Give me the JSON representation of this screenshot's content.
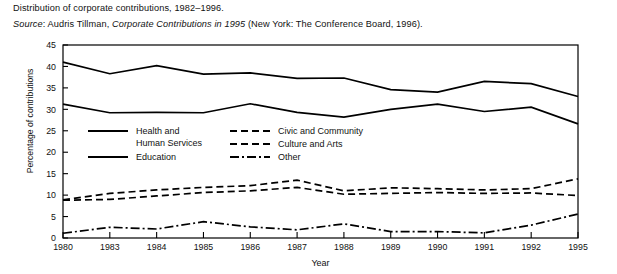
{
  "caption": {
    "line1": "Distribution of corporate contributions, 1982–1996.",
    "source_label": "Source",
    "source_sep": ": ",
    "source_author": "Audris Tillman, ",
    "source_title": "Corporate Contributions in 1995",
    "source_rest": " (New York: The Conference Board, 1996)."
  },
  "chart_data": {
    "type": "line",
    "title": "",
    "xlabel": "Year",
    "ylabel": "Percentage of contributions",
    "categories": [
      "1980",
      "1983",
      "1984",
      "1985",
      "1986",
      "1987",
      "1988",
      "1989",
      "1990",
      "1991",
      "1992",
      "1995"
    ],
    "x": [
      1980,
      1983,
      1984,
      1985,
      1986,
      1987,
      1988,
      1989,
      1990,
      1991,
      1992,
      1995
    ],
    "ylim": [
      0,
      45
    ],
    "xlim": [
      0,
      11
    ],
    "yticks": [
      0,
      5,
      10,
      15,
      20,
      25,
      30,
      35,
      40,
      45
    ],
    "ytick_labels": [
      "0",
      "5",
      "10",
      "15",
      "20",
      "25",
      "30",
      "35",
      "40",
      "45"
    ],
    "grid": false,
    "legend_position": "inside-upper-left",
    "series": [
      {
        "name": "Health and Human Services",
        "legend_label_line1": "Health and",
        "legend_label_line2": "Human Services",
        "style": "solid",
        "values": [
          41.0,
          38.3,
          40.2,
          38.2,
          38.5,
          37.2,
          37.3,
          34.6,
          34.0,
          36.5,
          36.0,
          33.0
        ]
      },
      {
        "name": "Education",
        "legend_label_line1": "Education",
        "legend_label_line2": "",
        "style": "solid",
        "values": [
          31.2,
          29.2,
          29.3,
          29.2,
          31.3,
          29.3,
          28.2,
          30.0,
          31.2,
          29.5,
          30.5,
          26.6
        ]
      },
      {
        "name": "Civic and Community",
        "legend_label_line1": "Civic and Community",
        "legend_label_line2": "",
        "style": "dashed",
        "values": [
          8.9,
          10.4,
          11.2,
          11.8,
          12.2,
          13.5,
          11.0,
          11.7,
          11.5,
          11.2,
          11.5,
          13.8
        ]
      },
      {
        "name": "Culture and Arts",
        "legend_label_line1": "Culture and Arts",
        "legend_label_line2": "",
        "style": "dashed",
        "values": [
          8.8,
          9.0,
          9.8,
          10.6,
          11.0,
          11.8,
          10.2,
          10.4,
          10.6,
          10.4,
          10.5,
          9.9
        ]
      },
      {
        "name": "Other",
        "legend_label_line1": "Other",
        "legend_label_line2": "",
        "style": "dashdot",
        "values": [
          1.1,
          2.5,
          2.1,
          3.8,
          2.6,
          1.9,
          3.3,
          1.5,
          1.5,
          1.2,
          3.0,
          5.6
        ]
      }
    ]
  }
}
